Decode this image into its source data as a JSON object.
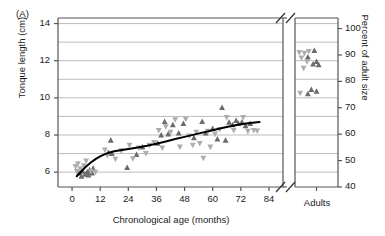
{
  "figure": {
    "panel_label": "(A)"
  },
  "chart_data": {
    "type": "scatter",
    "title": "",
    "xlabel": "Chronological age (months)",
    "ylabel": "Tonque length (cm)",
    "y2label": "Percent of adult size",
    "xlim": [
      -6,
      90
    ],
    "ylim": [
      5.2,
      14.3
    ],
    "y2lim": [
      40,
      104
    ],
    "grid": "horizontal",
    "legend": "none",
    "axis_break": {
      "x_axis": true,
      "note": "Main age axis is broken before the separate Adults category"
    },
    "xticks": [
      0,
      12,
      24,
      36,
      48,
      60,
      72,
      84
    ],
    "xtick_labels": [
      "0",
      "12",
      "24",
      "36",
      "48",
      "60",
      "72",
      "84"
    ],
    "x_category_label": "Adults",
    "yticks": [
      6,
      8,
      10,
      12,
      14
    ],
    "ytick_labels": [
      "6",
      "8",
      "10",
      "12",
      "14"
    ],
    "y_gridlines": [
      6,
      7,
      8,
      9,
      10,
      11,
      12,
      13,
      14
    ],
    "y2ticks": [
      40,
      50,
      60,
      70,
      80,
      90,
      100
    ],
    "y2tick_labels": [
      "40",
      "50",
      "60",
      "70",
      "80",
      "90",
      "100"
    ],
    "colors": {
      "series_up": "#6b6b6b",
      "series_down": "#adadad",
      "curve": "#000000",
      "grid": "#b5b5b5",
      "frame": "#555555"
    },
    "series": [
      {
        "name": "up-triangle",
        "marker": "triangle-up",
        "color": "#6b6b6b",
        "points": [
          [
            3.0,
            5.95
          ],
          [
            4.0,
            5.78
          ],
          [
            4.5,
            6.05
          ],
          [
            5.5,
            5.88
          ],
          [
            6.5,
            6.02
          ],
          [
            7.0,
            5.85
          ],
          [
            7.5,
            6.12
          ],
          [
            8.5,
            5.95
          ],
          [
            9.0,
            6.2
          ],
          [
            15.5,
            7.05
          ],
          [
            16.5,
            7.72
          ],
          [
            17.0,
            7.0
          ],
          [
            23.5,
            6.25
          ],
          [
            27.5,
            6.95
          ],
          [
            30.0,
            7.35
          ],
          [
            36.5,
            7.55
          ],
          [
            38.0,
            8.0
          ],
          [
            39.5,
            8.72
          ],
          [
            41.0,
            8.05
          ],
          [
            43.0,
            8.55
          ],
          [
            45.5,
            8.1
          ],
          [
            47.5,
            8.62
          ],
          [
            52.0,
            7.85
          ],
          [
            55.5,
            8.72
          ],
          [
            57.0,
            8.1
          ],
          [
            60.0,
            8.35
          ],
          [
            62.0,
            7.78
          ],
          [
            64.0,
            9.48
          ],
          [
            65.5,
            7.72
          ],
          [
            67.0,
            8.68
          ],
          [
            68.5,
            8.55
          ],
          [
            70.0,
            8.78
          ],
          [
            71.0,
            8.62
          ],
          [
            72.5,
            8.7
          ],
          [
            74.0,
            8.5
          ],
          [
            76.0,
            8.62
          ]
        ]
      },
      {
        "name": "down-triangle",
        "marker": "triangle-down",
        "color": "#adadad",
        "points": [
          [
            1.5,
            6.3
          ],
          [
            2.0,
            6.05
          ],
          [
            2.5,
            6.45
          ],
          [
            3.5,
            6.18
          ],
          [
            5.0,
            6.35
          ],
          [
            6.0,
            6.6
          ],
          [
            8.0,
            6.05
          ],
          [
            10.0,
            6.0
          ],
          [
            14.0,
            7.2
          ],
          [
            15.0,
            6.9
          ],
          [
            18.5,
            6.7
          ],
          [
            21.0,
            7.15
          ],
          [
            24.5,
            7.45
          ],
          [
            26.0,
            6.72
          ],
          [
            28.5,
            7.3
          ],
          [
            31.5,
            7.0
          ],
          [
            33.0,
            7.45
          ],
          [
            35.0,
            7.6
          ],
          [
            37.0,
            8.25
          ],
          [
            38.5,
            7.3
          ],
          [
            40.0,
            8.45
          ],
          [
            42.0,
            8.15
          ],
          [
            44.0,
            8.82
          ],
          [
            46.0,
            7.35
          ],
          [
            48.5,
            8.85
          ],
          [
            50.0,
            7.95
          ],
          [
            51.5,
            7.45
          ],
          [
            53.0,
            8.15
          ],
          [
            54.5,
            7.55
          ],
          [
            56.0,
            6.75
          ],
          [
            58.0,
            8.2
          ],
          [
            59.0,
            7.35
          ],
          [
            61.0,
            8.05
          ],
          [
            63.0,
            8.3
          ],
          [
            66.0,
            8.95
          ],
          [
            69.0,
            8.25
          ],
          [
            73.0,
            8.95
          ],
          [
            75.0,
            8.2
          ],
          [
            77.5,
            8.25
          ],
          [
            79.0,
            8.22
          ]
        ]
      },
      {
        "name": "adults-up-triangle",
        "marker": "triangle-up",
        "color": "#6b6b6b",
        "category": "Adults",
        "points": [
          [
            0.45,
            12.55
          ],
          [
            0.3,
            12.2
          ],
          [
            0.5,
            11.95
          ],
          [
            0.42,
            11.82
          ],
          [
            0.55,
            11.78
          ],
          [
            0.38,
            10.45
          ],
          [
            0.5,
            10.35
          ],
          [
            0.3,
            10.22
          ]
        ]
      },
      {
        "name": "adults-down-triangle",
        "marker": "triangle-down",
        "color": "#adadad",
        "category": "Adults",
        "points": [
          [
            0.1,
            12.45
          ],
          [
            0.22,
            12.4
          ],
          [
            0.32,
            12.5
          ],
          [
            0.15,
            12.15
          ],
          [
            0.28,
            11.95
          ],
          [
            0.2,
            11.6
          ],
          [
            0.12,
            10.25
          ]
        ]
      }
    ],
    "fit_curve": {
      "name": "growth curve",
      "color": "#000000",
      "points": [
        [
          2.0,
          5.78
        ],
        [
          4.0,
          6.05
        ],
        [
          6.0,
          6.3
        ],
        [
          8.0,
          6.52
        ],
        [
          10.0,
          6.7
        ],
        [
          12.0,
          6.85
        ],
        [
          14.0,
          6.97
        ],
        [
          16.0,
          7.06
        ],
        [
          18.0,
          7.12
        ],
        [
          20.0,
          7.17
        ],
        [
          24.0,
          7.25
        ],
        [
          28.0,
          7.33
        ],
        [
          32.0,
          7.42
        ],
        [
          36.0,
          7.53
        ],
        [
          40.0,
          7.65
        ],
        [
          44.0,
          7.78
        ],
        [
          48.0,
          7.9
        ],
        [
          52.0,
          8.02
        ],
        [
          56.0,
          8.14
        ],
        [
          60.0,
          8.26
        ],
        [
          64.0,
          8.38
        ],
        [
          68.0,
          8.49
        ],
        [
          72.0,
          8.58
        ],
        [
          76.0,
          8.65
        ],
        [
          80.0,
          8.7
        ]
      ]
    }
  }
}
